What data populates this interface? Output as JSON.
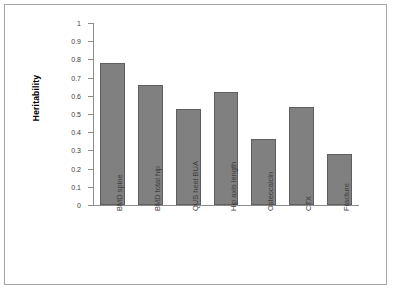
{
  "chart_data": {
    "type": "bar",
    "title": "",
    "subtitle": "",
    "xlabel": "",
    "ylabel": "Heritability",
    "categories": [
      "BMD spine",
      "BMD total hip",
      "QUS heel BUA",
      "Hip axis length",
      "Osteocalcin",
      "CTX",
      "Fracture"
    ],
    "values": [
      0.78,
      0.66,
      0.53,
      0.62,
      0.36,
      0.54,
      0.28
    ],
    "ylim": [
      0,
      1
    ],
    "ytick_labels": [
      "1",
      "0.9",
      "0.8",
      "0.7",
      "0.6",
      "0.5",
      "0.4",
      "0.3",
      "0.2",
      "0.1",
      "0"
    ],
    "ytick_values": [
      1,
      0.9,
      0.8,
      0.7,
      0.6,
      0.5,
      0.4,
      0.3,
      0.2,
      0.1,
      0
    ],
    "grid": false,
    "legend": null,
    "bar_color": "#808080",
    "bar_border_color": "#5e5e5e",
    "axis_color": "#8c8c8c",
    "frame_border_color": "#a6a6a6",
    "text_color": "#3d3d3d",
    "x_tick_label_rotation": -90
  }
}
